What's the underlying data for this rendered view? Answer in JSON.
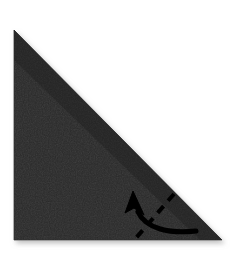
{
  "figure": {
    "kind": "origami-diagram",
    "title": "Origami fold step: triangle with upward fold arrow",
    "canvas": {
      "width": 236,
      "height": 261
    },
    "background_color": "#ffffff"
  },
  "paper": {
    "name": "triangle-paper",
    "shape": "right-triangle",
    "fill_color": "#262626",
    "edge_color": "#1d1d1d",
    "shadow_color": "#c9c9c9",
    "points": "14,30 14,240 222,240",
    "apex": {
      "x": 14,
      "y": 30
    },
    "bottom_left": {
      "x": 14,
      "y": 240
    },
    "bottom_right": {
      "x": 222,
      "y": 240
    },
    "description": "Dark charcoal square folded in half diagonally, hypotenuse running from top-left apex down to bottom-right corner"
  },
  "annotations": {
    "fold_line": {
      "name": "dashed-fold-line",
      "style": "dashed",
      "color": "#000000",
      "stroke_width": 4,
      "dash_pattern": "9 7",
      "path": "M 174,194 L 136,238",
      "description": "Dashed valley-fold line running diagonally from the hypotenuse down to the bottom edge"
    },
    "fold_arrow": {
      "name": "fold-direction-arrow",
      "color": "#000000",
      "stroke_width": 5,
      "path": "M 196,231 C 170,234 146,229 138,212",
      "head_points": "133,191 125,212 133,208 143,214",
      "tip": {
        "x": 133,
        "y": 191
      },
      "tail": {
        "x": 196,
        "y": 231
      },
      "direction": "up-left",
      "description": "Solid curved arrow sweeping from the lower right corner leftward and curving upward, indicating the corner folds up across the dashed line"
    }
  }
}
